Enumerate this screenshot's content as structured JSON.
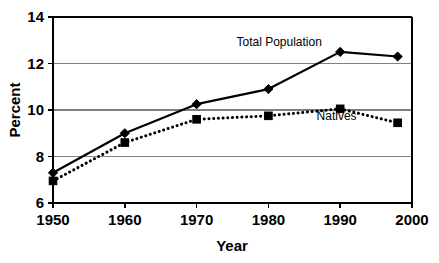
{
  "chart_data": {
    "type": "line",
    "title": "",
    "xlabel": "Year",
    "ylabel": "Percent",
    "xlim": [
      1950,
      2000
    ],
    "ylim": [
      6,
      14
    ],
    "xticks": [
      1950,
      1960,
      1970,
      1980,
      1990,
      2000
    ],
    "yticks": [
      6,
      8,
      10,
      12,
      14
    ],
    "xticklabels": [
      "1950",
      "1960",
      "1970",
      "1980",
      "1990",
      "2000"
    ],
    "yticklabels": [
      "6",
      "8",
      "10",
      "12",
      "14"
    ],
    "grid": "horizontal",
    "legend_position": "inline-annotation",
    "x": [
      1950,
      1960,
      1970,
      1980,
      1990,
      1998
    ],
    "series": [
      {
        "name": "Total Population",
        "marker": "diamond",
        "linestyle": "solid",
        "color": "#000000",
        "values": [
          7.3,
          9.0,
          10.25,
          10.9,
          12.5,
          12.3
        ]
      },
      {
        "name": "Natives",
        "marker": "square",
        "linestyle": "dotted",
        "color": "#000000",
        "values": [
          6.95,
          8.6,
          9.6,
          9.75,
          10.05,
          9.45
        ]
      }
    ],
    "annotations": [
      {
        "text": "Total Population",
        "x": 1981.5,
        "y": 12.75
      },
      {
        "text": "Natives",
        "x": 1989.5,
        "y": 9.55
      }
    ]
  }
}
